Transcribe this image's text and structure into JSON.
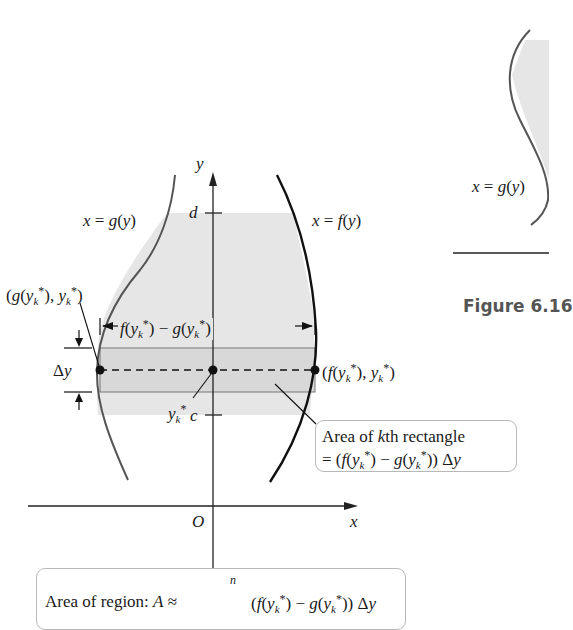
{
  "figure": {
    "caption": "Figure 6.16",
    "colors": {
      "shade": "#e6e6e6",
      "curve_g": "#555555",
      "curve_f": "#111111",
      "axis": "#222222",
      "box_border": "#b8b8b8"
    },
    "axes": {
      "x_label": "x",
      "y_label": "y",
      "origin_label": "O"
    },
    "ticks": {
      "upper": "d",
      "lower": "c"
    },
    "curves": {
      "left_label": "x = g(y)",
      "right_label": "x = f(y)",
      "right_panel_label": "x = g(y)"
    },
    "annotations": {
      "left_point": "(g(y_k*), y_k*)",
      "right_point": "(f(y_k*), y_k*)",
      "width_label": "f(y_k*) − g(y_k*)",
      "delta_y": "Δy",
      "sample_point": "y_k*"
    },
    "rect_box": {
      "line1": "Area of kth rectangle",
      "line2": "= (f(y_k*) − g(y_k*)) Δy"
    },
    "sum_box": {
      "text": "Area of region: A ≈ Σ_{k=1}^{n} (f(y_k*) − g(y_k*)) Δy",
      "upper_limit": "n"
    }
  }
}
